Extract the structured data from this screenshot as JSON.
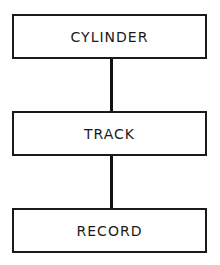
{
  "diagram": {
    "type": "hierarchy",
    "nodes": [
      {
        "id": "cylinder",
        "label": "CYLINDER"
      },
      {
        "id": "track",
        "label": "TRACK"
      },
      {
        "id": "record",
        "label": "RECORD"
      }
    ],
    "edges": [
      {
        "from": "cylinder",
        "to": "track"
      },
      {
        "from": "track",
        "to": "record"
      }
    ],
    "colors": {
      "line": "#111111",
      "background": "#ffffff"
    }
  }
}
